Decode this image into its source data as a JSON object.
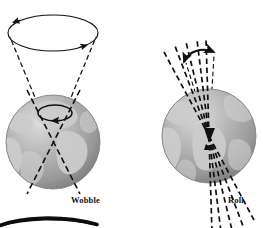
{
  "figure": {
    "background_color": "#ffffff",
    "panels": [
      {
        "id": "wobble",
        "label": "Wobble",
        "label_x": 71,
        "label_y": 196,
        "description": "Earth globe with rotation axis tracing a precession cone; a large ellipse at top shows the path of the axis, with arrowheads indicating direction of travel.",
        "globe": {
          "center_x": 53,
          "center_y": 142,
          "radius": 47,
          "ocean_color": "#a3a3a3",
          "land_color": "#c9c9c9",
          "shadow_color": "#6f6f6f",
          "highlight_color": "#d8d8d8"
        },
        "precession_ellipse": {
          "center_x": 53,
          "center_y": 33,
          "rx": 45,
          "ry": 18,
          "stroke_color": "#111111",
          "stroke_width": 1.1,
          "arrow_count": 2
        },
        "cone_lines": [
          {
            "x1": 53,
            "y1": 141,
            "x2": 9,
            "y2": 36
          },
          {
            "x1": 53,
            "y1": 141,
            "x2": 97,
            "y2": 36
          }
        ],
        "axis_lines": [
          {
            "x1": 79,
            "y1": 92,
            "x2": 28,
            "y2": 192
          },
          {
            "x1": 28,
            "y1": 92,
            "x2": 79,
            "y2": 192
          }
        ],
        "pole_ellipse": {
          "center_x": 55,
          "center_y": 113,
          "rx": 17,
          "ry": 8,
          "stroke_color": "#111111"
        }
      },
      {
        "id": "roll",
        "label": "Roll",
        "label_x": 228,
        "label_y": 196,
        "description": "Earth globe with a fan of dashed axis positions converging at the planet's centre; a double-headed curved arrow above shows the axis rocking back and forth.",
        "globe": {
          "center_x": 209,
          "center_y": 136,
          "radius": 47,
          "ocean_color": "#a3a3a3",
          "land_color": "#c9c9c9",
          "shadow_color": "#6f6f6f",
          "highlight_color": "#d8d8d8"
        },
        "rock_arrow": {
          "start_x": 186,
          "start_y": 60,
          "end_x": 215,
          "end_y": 53,
          "double_headed": true,
          "stroke_color": "#111111",
          "stroke_width": 2.0
        },
        "fan_lines": [
          {
            "angle_deg": -28
          },
          {
            "angle_deg": -22
          },
          {
            "angle_deg": -16
          },
          {
            "angle_deg": -10
          },
          {
            "angle_deg": -4
          }
        ],
        "fan_origin_x": 209,
        "fan_origin_y": 136,
        "fan_length": 95,
        "guide_lines": [
          {
            "x1": 209,
            "y1": 136,
            "x2": 186,
            "y2": 62
          },
          {
            "x1": 209,
            "y1": 136,
            "x2": 215,
            "y2": 55
          }
        ]
      },
      {
        "id": "third-figure-cropped",
        "label": "",
        "description": "Top edge of a third illustration, cropped by the image boundary: a thick dark elliptical arc sweeping across the lower-left.",
        "arc": {
          "start_x": 0,
          "start_y": 224,
          "end_x": 97,
          "end_y": 224,
          "control_x": 48,
          "control_y": 215,
          "stroke_color": "#0d0d0d",
          "max_stroke_width": 4.0
        }
      }
    ],
    "style": {
      "dash_pattern": "5,3",
      "line_color": "#111111",
      "label_font_weight": "bold",
      "label_font_size_px": 8.5
    }
  }
}
